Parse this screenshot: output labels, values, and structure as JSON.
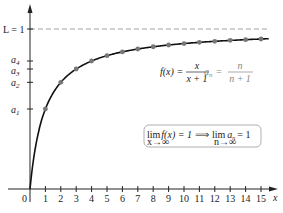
{
  "chart_data": {
    "type": "line",
    "title": "",
    "xlabel": "x",
    "ylabel": "",
    "function_label": "f(x) = x / (x + 1)",
    "sequence_label": "a_n = n / (n + 1)",
    "limit_statement": "lim_{x→∞} f(x) = 1 ⟹ lim_{n→∞} a_n = 1",
    "asymptote_label": "L = 1",
    "y_tick_labels": [
      "a1",
      "a2",
      "a3",
      "a4",
      "L = 1"
    ],
    "x_ticks": [
      1,
      2,
      3,
      4,
      5,
      6,
      7,
      8,
      9,
      10,
      11,
      12,
      13,
      14,
      15
    ],
    "origin_label": "0",
    "xlim": [
      0,
      15.8
    ],
    "ylim": [
      0,
      1.1
    ],
    "series": [
      {
        "name": "a_n",
        "x": [
          1,
          2,
          3,
          4,
          5,
          6,
          7,
          8,
          9,
          10,
          11,
          12,
          13,
          14,
          15
        ],
        "values": [
          0.5,
          0.667,
          0.75,
          0.8,
          0.833,
          0.857,
          0.875,
          0.889,
          0.9,
          0.909,
          0.917,
          0.923,
          0.929,
          0.933,
          0.9375
        ]
      }
    ]
  },
  "labels": {
    "L": "L = 1",
    "a1": "a",
    "a1sub": "1",
    "a2": "a",
    "a2sub": "2",
    "a3": "a",
    "a3sub": "3",
    "a4": "a",
    "a4sub": "4",
    "origin": "0",
    "xaxis": "x",
    "fx_left": "f(x) =",
    "fx_num": "x",
    "fx_den": "x + 1",
    "an_left": "a",
    "an_sub": "n",
    "an_eq": "=",
    "an_num": "n",
    "an_den": "n + 1",
    "lim1": "lim",
    "lim1_sub": "x→∞",
    "lim1_expr": "f(x) = 1",
    "implies": "⟹",
    "lim2": "lim",
    "lim2_sub": "n→∞",
    "lim2_expr_a": "a",
    "lim2_expr_sub": "n",
    "lim2_expr_eq": "= 1",
    "xticks": [
      "1",
      "2",
      "3",
      "4",
      "5",
      "6",
      "7",
      "8",
      "9",
      "10",
      "11",
      "12",
      "13",
      "14",
      "15"
    ]
  }
}
